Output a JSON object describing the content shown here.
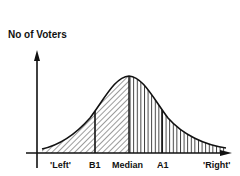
{
  "diagram": {
    "type": "normal-distribution",
    "y_axis_label": "No of Voters",
    "x_labels": {
      "left": "'Left'",
      "b1": "B1",
      "median": "Median",
      "a1": "A1",
      "right": "'Right'"
    },
    "regions": [
      {
        "name": "left-of-median",
        "hatch": "diagonal"
      },
      {
        "name": "right-of-median",
        "hatch": "vertical"
      }
    ],
    "markers": [
      "B1",
      "Median",
      "A1"
    ],
    "colors": {
      "ink": "#111111",
      "background": "#ffffff"
    }
  }
}
